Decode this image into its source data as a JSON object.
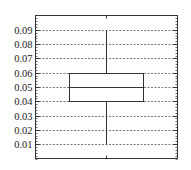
{
  "chart_data": {
    "type": "box",
    "title": "",
    "xlabel": "",
    "ylabel": "",
    "ylim": [
      0.0,
      0.1
    ],
    "yticks": [
      0.01,
      0.02,
      0.03,
      0.04,
      0.05,
      0.06,
      0.07,
      0.08,
      0.09
    ],
    "ytick_labels": [
      "0.01",
      "0.02",
      "0.03",
      "0.04",
      "0.05",
      "0.06",
      "0.07",
      "0.08",
      "0.09"
    ],
    "grid": true,
    "grid_style": "dashed horizontal",
    "legend": "none",
    "series": [
      {
        "name": "",
        "whisker_low": 0.01,
        "q1": 0.04,
        "median": 0.05,
        "q3": 0.06,
        "whisker_high": 0.09
      }
    ],
    "colors": {
      "axis": "#333333",
      "grid": "#555555",
      "box": "#333333"
    }
  }
}
